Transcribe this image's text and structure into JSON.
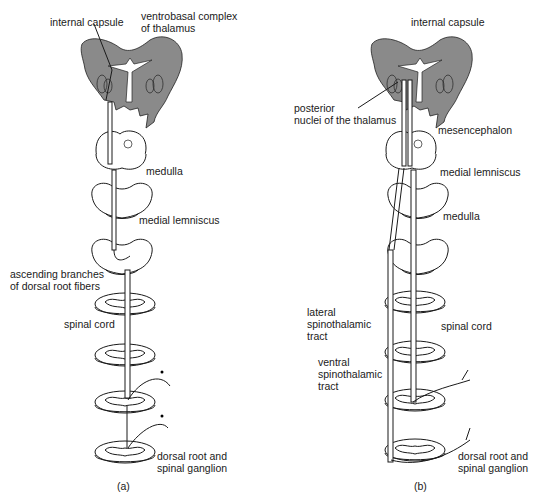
{
  "panels": [
    {
      "id": "a",
      "caption": "(a)",
      "labels": {
        "internal_capsule": "internal capsule",
        "ventrobasal_1": "ventrobasal complex",
        "ventrobasal_2": "of thalamus",
        "medulla": "medulla",
        "medial_lemniscus": "medial lemniscus",
        "ascending_1": "ascending branches",
        "ascending_2": "of dorsal root fibers",
        "spinal_cord": "spinal cord",
        "dorsal_root_1": "dorsal root and",
        "dorsal_root_2": "spinal ganglion"
      }
    },
    {
      "id": "b",
      "caption": "(b)",
      "labels": {
        "internal_capsule": "internal capsule",
        "posterior_1": "posterior",
        "posterior_2": "nuclei of the thalamus",
        "mesencephalon": "mesencephalon",
        "medial_lemniscus": "medial lemniscus",
        "medulla": "medulla",
        "lateral_1": "lateral",
        "lateral_2": "spinothalamic",
        "lateral_3": "tract",
        "spinal_cord": "spinal cord",
        "ventral_1": "ventral",
        "ventral_2": "spinothalamic",
        "ventral_3": "tract",
        "dorsal_root_1": "dorsal root and",
        "dorsal_root_2": "spinal ganglion"
      }
    }
  ]
}
